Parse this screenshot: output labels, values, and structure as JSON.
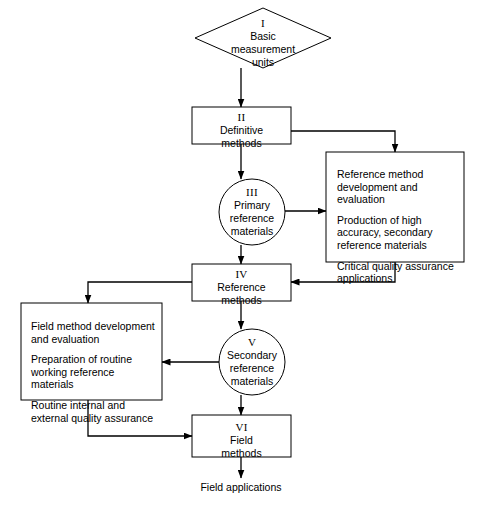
{
  "diagram": {
    "line_color": "#000000",
    "background_color": "#ffffff",
    "nodes": {
      "basic_units": {
        "numeral": "I",
        "lines": [
          "Basic",
          "measurement",
          "units"
        ],
        "shape": "diamond"
      },
      "definitive_methods": {
        "numeral": "II",
        "lines": [
          "Definitive",
          "methods"
        ],
        "shape": "rectangle"
      },
      "primary_reference_materials": {
        "numeral": "III",
        "lines": [
          "Primary",
          "reference",
          "materials"
        ],
        "shape": "circle"
      },
      "reference_methods": {
        "numeral": "IV",
        "lines": [
          "Reference",
          "methods"
        ],
        "shape": "rectangle"
      },
      "secondary_reference_materials": {
        "numeral": "V",
        "lines": [
          "Secondary",
          "reference",
          "materials"
        ],
        "shape": "circle"
      },
      "field_methods": {
        "numeral": "VI",
        "lines": [
          "Field",
          "methods"
        ],
        "shape": "rectangle"
      }
    },
    "panels": {
      "right_panel": {
        "paragraphs": [
          "Reference method development and evaluation",
          "Production of high accuracy, secondary reference materials",
          "Critical quality assurance applications"
        ]
      },
      "left_panel": {
        "paragraphs": [
          "Field method development and evaluation",
          "Preparation of routine working reference materials",
          "Routine internal and external quality assurance"
        ]
      }
    },
    "footer": {
      "label": "Field applications"
    }
  }
}
